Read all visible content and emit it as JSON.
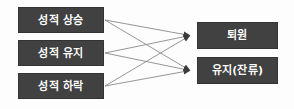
{
  "diagram": {
    "type": "bipartite-flow-diagram",
    "background_color": "#fdfdfd",
    "node_fill_color": "#414141",
    "node_border_color": "#333333",
    "node_text_color": "#ffffff",
    "edge_color": "#8a8a8a",
    "arrowhead_color": "#3b3b3b",
    "source_nodes": [
      {
        "id": "grade-rise",
        "label": "성적 상승"
      },
      {
        "id": "grade-maintain",
        "label": "성적 유지"
      },
      {
        "id": "grade-decline",
        "label": "성적 하락"
      }
    ],
    "target_nodes": [
      {
        "id": "discharge",
        "label": "퇴원"
      },
      {
        "id": "stay",
        "label": "유지(잔류)"
      }
    ],
    "edges": [
      {
        "from": "grade-rise",
        "to": "discharge"
      },
      {
        "from": "grade-rise",
        "to": "stay"
      },
      {
        "from": "grade-maintain",
        "to": "discharge"
      },
      {
        "from": "grade-maintain",
        "to": "stay"
      },
      {
        "from": "grade-decline",
        "to": "discharge"
      },
      {
        "from": "grade-decline",
        "to": "stay"
      }
    ]
  }
}
